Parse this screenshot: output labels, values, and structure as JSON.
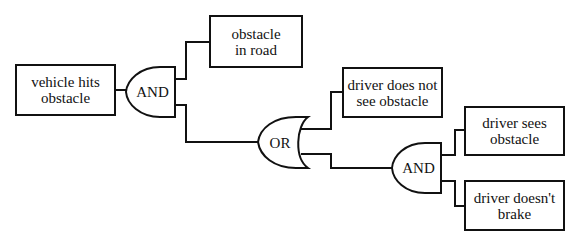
{
  "diagram": {
    "type": "fault-tree",
    "nodes": [
      {
        "id": "top",
        "kind": "event",
        "line1": "vehicle hits",
        "line2": "obstacle"
      },
      {
        "id": "and1",
        "kind": "gate",
        "label": "AND"
      },
      {
        "id": "e_road",
        "kind": "event",
        "line1": "obstacle",
        "line2": "in road"
      },
      {
        "id": "or1",
        "kind": "gate",
        "label": "OR"
      },
      {
        "id": "e_notsee",
        "kind": "event",
        "line1": "driver does not",
        "line2": "see obstacle"
      },
      {
        "id": "and2",
        "kind": "gate",
        "label": "AND"
      },
      {
        "id": "e_sees",
        "kind": "event",
        "line1": "driver sees",
        "line2": "obstacle"
      },
      {
        "id": "e_nobrake",
        "kind": "event",
        "line1": "driver doesn't",
        "line2": "brake"
      }
    ],
    "edges": [
      [
        "top",
        "and1"
      ],
      [
        "and1",
        "e_road"
      ],
      [
        "and1",
        "or1"
      ],
      [
        "or1",
        "e_notsee"
      ],
      [
        "or1",
        "and2"
      ],
      [
        "and2",
        "e_sees"
      ],
      [
        "and2",
        "e_nobrake"
      ]
    ]
  },
  "labels": {
    "top": {
      "l1": "vehicle hits",
      "l2": "obstacle"
    },
    "and1": "AND",
    "road": {
      "l1": "obstacle",
      "l2": "in road"
    },
    "or1": "OR",
    "notsee": {
      "l1": "driver does not",
      "l2": "see obstacle"
    },
    "and2": "AND",
    "sees": {
      "l1": "driver sees",
      "l2": "obstacle"
    },
    "nobrake": {
      "l1": "driver doesn't",
      "l2": "brake"
    }
  }
}
